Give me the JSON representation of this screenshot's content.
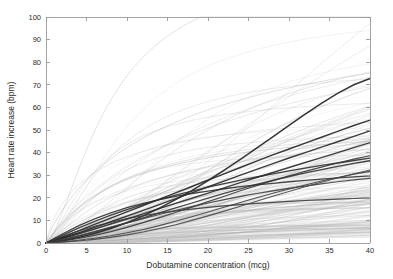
{
  "chart_data": {
    "type": "line",
    "title": "",
    "xlabel": "Dobutamine concentration (mcg)",
    "ylabel": "Heart rate increase (bpm)",
    "xlim": [
      0,
      40
    ],
    "ylim": [
      0,
      100
    ],
    "xticks": [
      0,
      5,
      10,
      15,
      20,
      25,
      30,
      35,
      40
    ],
    "yticks": [
      0,
      10,
      20,
      30,
      40,
      50,
      60,
      70,
      80,
      90,
      100
    ],
    "xtick_labels": [
      "0",
      "5",
      "10",
      "15",
      "20",
      "25",
      "30",
      "35",
      "40"
    ],
    "ytick_labels": [
      "0",
      "10",
      "20",
      "30",
      "40",
      "50",
      "60",
      "70",
      "80",
      "90",
      "100"
    ],
    "grid": false,
    "legend": null,
    "legend_position": "none",
    "x": [
      0,
      2,
      4,
      6,
      8,
      10,
      12,
      14,
      16,
      18,
      20,
      22,
      24,
      26,
      28,
      30,
      32,
      34,
      36,
      38,
      40
    ],
    "series": [
      {
        "name": "highlight-1",
        "emphasis": "dark",
        "color": "#1a1a1a",
        "width": 1.5,
        "values": [
          0,
          1.0,
          2.4,
          4.2,
          6.4,
          9.0,
          12.0,
          15.4,
          19.2,
          23.2,
          27.6,
          32.2,
          37.0,
          42.0,
          47.0,
          52.0,
          57.0,
          61.8,
          66.2,
          70.0,
          72.8
        ]
      },
      {
        "name": "highlight-2",
        "emphasis": "dark",
        "color": "#1f1f1f",
        "width": 1.4,
        "values": [
          0,
          2.6,
          5.4,
          8.2,
          11.0,
          13.8,
          16.6,
          19.4,
          22.2,
          25.0,
          27.8,
          30.6,
          33.4,
          36.2,
          39.0,
          41.6,
          44.2,
          46.8,
          49.4,
          52.0,
          54.4
        ]
      },
      {
        "name": "highlight-3",
        "emphasis": "dark",
        "color": "#222222",
        "width": 1.4,
        "values": [
          0,
          2.2,
          4.5,
          6.9,
          9.4,
          11.9,
          14.4,
          17.0,
          19.6,
          22.2,
          24.8,
          27.4,
          30.0,
          32.6,
          35.1,
          37.6,
          40.0,
          42.4,
          44.8,
          47.2,
          49.6
        ]
      },
      {
        "name": "highlight-4",
        "emphasis": "dark",
        "color": "#262626",
        "width": 1.4,
        "values": [
          0,
          2.0,
          4.1,
          6.2,
          8.4,
          10.6,
          12.9,
          15.2,
          17.5,
          19.8,
          22.1,
          24.4,
          26.7,
          29.0,
          31.2,
          33.4,
          35.6,
          37.8,
          40.0,
          42.2,
          44.4
        ]
      },
      {
        "name": "highlight-5",
        "emphasis": "dark",
        "color": "#2a2a2a",
        "width": 1.3,
        "values": [
          0,
          3.4,
          6.6,
          9.6,
          12.3,
          14.8,
          17.1,
          19.2,
          21.2,
          23.0,
          24.7,
          26.3,
          27.8,
          29.2,
          30.6,
          31.9,
          33.1,
          34.3,
          35.4,
          36.5,
          37.6
        ]
      },
      {
        "name": "highlight-6",
        "emphasis": "dark",
        "color": "#2e2e2e",
        "width": 1.3,
        "values": [
          0,
          4.0,
          7.6,
          10.7,
          13.3,
          15.6,
          17.5,
          19.2,
          20.6,
          21.9,
          23.0,
          24.0,
          24.9,
          25.7,
          26.4,
          27.1,
          27.7,
          28.3,
          28.8,
          29.3,
          29.7
        ]
      },
      {
        "name": "highlight-7",
        "emphasis": "dark",
        "color": "#303030",
        "width": 1.3,
        "values": [
          0,
          1.4,
          3.0,
          4.8,
          6.8,
          8.9,
          11.1,
          13.3,
          15.5,
          17.7,
          19.9,
          22.0,
          24.0,
          25.9,
          27.7,
          29.4,
          31.0,
          32.5,
          33.9,
          35.2,
          36.4
        ]
      },
      {
        "name": "highlight-8",
        "emphasis": "dark",
        "color": "#343434",
        "width": 1.2,
        "values": [
          0,
          0.9,
          2.0,
          3.4,
          5.0,
          6.9,
          9.0,
          11.2,
          13.5,
          15.9,
          18.3,
          20.7,
          23.1,
          25.4,
          27.6,
          29.7,
          31.7,
          33.6,
          35.4,
          37.1,
          38.6
        ]
      },
      {
        "name": "highlight-9",
        "emphasis": "dark",
        "color": "#383838",
        "width": 1.2,
        "values": [
          0,
          2.8,
          5.3,
          7.4,
          9.2,
          10.8,
          12.1,
          13.2,
          14.2,
          15.0,
          15.8,
          16.4,
          17.0,
          17.5,
          18.0,
          18.4,
          18.8,
          19.1,
          19.4,
          19.7,
          20.0
        ]
      },
      {
        "name": "highlight-10",
        "emphasis": "dark",
        "color": "#3c3c3c",
        "width": 1.2,
        "values": [
          0,
          1.6,
          3.3,
          5.1,
          7.0,
          8.9,
          10.8,
          12.6,
          14.4,
          16.1,
          17.7,
          19.2,
          20.6,
          21.9,
          23.1,
          24.2,
          25.2,
          26.2,
          27.1,
          27.9,
          28.6
        ]
      },
      {
        "name": "highlight-11",
        "emphasis": "dark",
        "color": "#404040",
        "width": 1.1,
        "values": [
          0,
          0.5,
          1.2,
          2.1,
          3.2,
          4.5,
          6.0,
          7.7,
          9.6,
          11.6,
          13.7,
          15.8,
          17.9,
          20.0,
          22.0,
          23.9,
          25.7,
          27.4,
          29.0,
          30.4,
          31.7
        ]
      },
      {
        "name": "highlight-12",
        "emphasis": "dark",
        "color": "#444444",
        "width": 1.1,
        "values": [
          0,
          0.4,
          0.9,
          1.6,
          2.5,
          3.6,
          4.9,
          6.4,
          8.1,
          10.0,
          12.0,
          14.1,
          16.3,
          18.5,
          20.7,
          22.8,
          24.9,
          26.9,
          28.8,
          30.6,
          32.3
        ]
      },
      {
        "name": "background-bundle",
        "emphasis": "faint",
        "color": "#b5b5b5",
        "width": 0.45,
        "count": 180,
        "emax_range": [
          8,
          130
        ],
        "ec50_range": [
          6,
          95
        ],
        "hill_range": [
          0.85,
          2.3
        ],
        "note": "Large faint population of curves spanning the whole panel; densest between 0 and 30 bpm, sparsest fringe reaching ~95 bpm at 40 mcg."
      }
    ]
  },
  "axes": {
    "x_axis_label": "Dobutamine concentration (mcg)",
    "y_axis_label": "Heart rate increase (bpm)"
  }
}
